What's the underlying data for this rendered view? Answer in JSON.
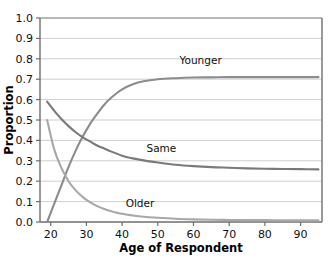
{
  "chart_data": {
    "type": "line",
    "title": "",
    "xlabel": "Age of Respondent",
    "ylabel": "Proportion",
    "xlim": [
      17,
      96
    ],
    "ylim": [
      0.0,
      1.0
    ],
    "grid": true,
    "legend_position": "inline-labels",
    "xticks": [
      20,
      30,
      40,
      50,
      60,
      70,
      80,
      90
    ],
    "xtick_labels": [
      "20",
      "30",
      "40",
      "50",
      "60",
      "70",
      "80",
      "90"
    ],
    "yticks": [
      0.0,
      0.1,
      0.2,
      0.3,
      0.4,
      0.5,
      0.6,
      0.7,
      0.8,
      0.9,
      1.0
    ],
    "ytick_labels": [
      "0.0",
      "0.1",
      "0.2",
      "0.3",
      "0.4",
      "0.5",
      "0.6",
      "0.7",
      "0.8",
      "0.9",
      "1.0"
    ],
    "x": [
      19,
      21,
      23,
      25,
      27,
      29,
      31,
      33,
      35,
      37,
      40,
      43,
      46,
      50,
      55,
      60,
      65,
      70,
      75,
      80,
      85,
      90,
      95
    ],
    "series": [
      {
        "name": "Younger",
        "color": "#8c8c8c",
        "label_text": "Younger",
        "label_x": 62,
        "label_y": 0.775,
        "values": [
          0.0,
          0.09,
          0.18,
          0.27,
          0.35,
          0.42,
          0.48,
          0.53,
          0.575,
          0.61,
          0.65,
          0.675,
          0.69,
          0.7,
          0.705,
          0.708,
          0.709,
          0.71,
          0.71,
          0.71,
          0.71,
          0.71,
          0.71
        ]
      },
      {
        "name": "Same",
        "color": "#7a7a7a",
        "label_text": "Same",
        "label_x": 51,
        "label_y": 0.345,
        "values": [
          0.59,
          0.545,
          0.505,
          0.47,
          0.44,
          0.415,
          0.395,
          0.375,
          0.36,
          0.345,
          0.325,
          0.312,
          0.302,
          0.292,
          0.281,
          0.274,
          0.269,
          0.266,
          0.263,
          0.261,
          0.26,
          0.259,
          0.258
        ]
      },
      {
        "name": "Older",
        "color": "#a8a8a8",
        "label_text": "Older",
        "label_x": 45,
        "label_y": 0.075,
        "values": [
          0.5,
          0.355,
          0.265,
          0.2,
          0.155,
          0.122,
          0.097,
          0.078,
          0.064,
          0.053,
          0.04,
          0.032,
          0.026,
          0.021,
          0.016,
          0.013,
          0.011,
          0.01,
          0.009,
          0.009,
          0.008,
          0.008,
          0.008
        ]
      }
    ]
  },
  "figure": {
    "background": "#ffffff",
    "grid_color": "#c9c9c9",
    "axis_color": "#6e6e6e",
    "text_color": "#101010"
  }
}
